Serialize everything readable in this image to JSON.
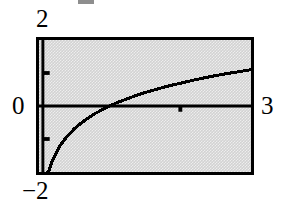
{
  "figure": {
    "name": "natural-logarithm-graph",
    "background_color": "#ffffff",
    "panel_color": "#d2d2d2",
    "frame_color": "#000000",
    "curve_color": "#000000"
  },
  "labels": {
    "y_max": "2",
    "y_zero": "0",
    "x_max": "3",
    "y_min": "−2"
  },
  "chart_data": {
    "type": "line",
    "title": "",
    "subtitle": "",
    "xlabel": "",
    "ylabel": "",
    "xlim": [
      0,
      3
    ],
    "ylim": [
      -2,
      2
    ],
    "grid": false,
    "legend": "none",
    "x_tick_labels": [
      "0",
      "3"
    ],
    "y_tick_labels": [
      "-2",
      "0",
      "2"
    ],
    "x_axis_ticks": [
      2
    ],
    "y_axis_ticks": [
      -1,
      1
    ],
    "axis_lines": {
      "x_axis_at_y": 0,
      "y_axis_at_x": 0
    },
    "series": [
      {
        "name": "y = ln(x)",
        "x": [
          0.12,
          0.14,
          0.17,
          0.2,
          0.25,
          0.3,
          0.35,
          0.4,
          0.5,
          0.6,
          0.7,
          0.8,
          0.9,
          1.0,
          1.1,
          1.2,
          1.4,
          1.6,
          1.8,
          2.0,
          2.2,
          2.4,
          2.6,
          2.8,
          3.0
        ],
        "y": [
          -2.0,
          -1.97,
          -1.77,
          -1.61,
          -1.39,
          -1.2,
          -1.05,
          -0.92,
          -0.69,
          -0.51,
          -0.36,
          -0.22,
          -0.11,
          0.0,
          0.1,
          0.18,
          0.34,
          0.47,
          0.59,
          0.69,
          0.79,
          0.88,
          0.96,
          1.03,
          1.1
        ]
      }
    ]
  }
}
